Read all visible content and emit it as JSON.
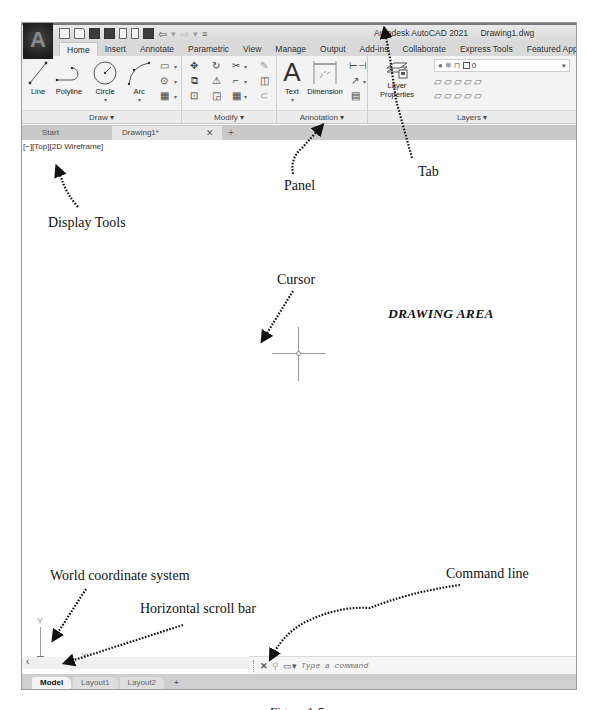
{
  "window": {
    "app_title": "Autodesk AutoCAD 2021",
    "file_title": "Drawing1.dwg",
    "logo_letter": "A"
  },
  "quick_access": [
    "new-icon",
    "open-icon",
    "save-icon",
    "save-as-icon",
    "plot-preview-icon",
    "publish-icon",
    "print-icon",
    "undo-icon",
    "redo-icon",
    "customize-icon"
  ],
  "ribbon_tabs": [
    {
      "label": "Home",
      "active": true
    },
    {
      "label": "Insert"
    },
    {
      "label": "Annotate"
    },
    {
      "label": "Parametric"
    },
    {
      "label": "View"
    },
    {
      "label": "Manage"
    },
    {
      "label": "Output"
    },
    {
      "label": "Add-ins"
    },
    {
      "label": "Collaborate"
    },
    {
      "label": "Express Tools"
    },
    {
      "label": "Featured Apps"
    }
  ],
  "panels": {
    "draw": {
      "title": "Draw ▾",
      "tools": [
        "Line",
        "Polyline",
        "Circle",
        "Arc"
      ],
      "small_tools": [
        "rectangle-icon",
        "ellipse-icon",
        "hatch-icon"
      ]
    },
    "modify": {
      "title": "Modify ▾",
      "small_tools": [
        "move-icon",
        "rotate-icon",
        "trim-icon",
        "erase-icon",
        "copy-icon",
        "mirror-icon",
        "fillet-icon",
        "explode-icon",
        "stretch-icon",
        "scale-icon",
        "array-icon",
        "offset-icon"
      ]
    },
    "annotation": {
      "title": "Annotation ▾",
      "tools": [
        "Text",
        "Dimension"
      ],
      "small_tools": [
        "linear-dim-icon",
        "leader-icon",
        "table-icon"
      ]
    },
    "layers": {
      "title": "Layers ▾",
      "tool_line1": "Layer",
      "tool_line2": "Properties",
      "current_layer": "0",
      "dropdown_caret": "▾"
    }
  },
  "file_tabs": [
    {
      "label": "Start"
    },
    {
      "label": "Drawing1*",
      "active": true,
      "close": "✕"
    },
    {
      "label": "+"
    }
  ],
  "viewport": {
    "label": "[−][Top][2D Wireframe]"
  },
  "ucs": {
    "x_label": "X",
    "y_label": "Y"
  },
  "scrollbar": {
    "left_arrow": "‹"
  },
  "command_line": {
    "close": "✕",
    "customize": "🔧",
    "recent": "▭▾",
    "placeholder": "Type a command",
    "value": ""
  },
  "layout_tabs": [
    {
      "label": "Model",
      "active": true
    },
    {
      "label": "Layout1"
    },
    {
      "label": "Layout2"
    },
    {
      "label": "+"
    }
  ],
  "annotations": {
    "tab": "Tab",
    "panel": "Panel",
    "display_tools": "Display Tools",
    "cursor": "Cursor",
    "drawing_area": "DRAWING AREA",
    "world_coordinate_system": "World coordinate system",
    "horizontal_scroll_bar": "Horizontal scroll bar",
    "command_line": "Command line"
  },
  "caption": "Figure 1-5"
}
